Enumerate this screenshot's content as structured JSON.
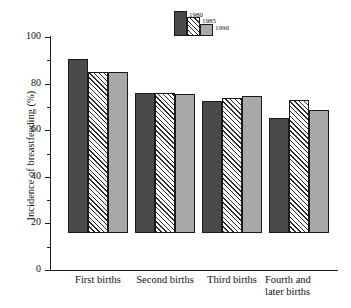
{
  "chart_data": {
    "type": "bar",
    "title": "",
    "xlabel": "",
    "ylabel": "Incidence of breastfeeding (%)",
    "ylim": [
      0,
      100
    ],
    "yticks": [
      "0",
      "20",
      "40",
      "60",
      "80",
      "100"
    ],
    "ytick_values": [
      0,
      20,
      40,
      60,
      80,
      100
    ],
    "minor_tick_values": [
      10,
      30,
      50,
      70,
      90
    ],
    "grid": false,
    "legend_position": "top-center",
    "categories": [
      "First births",
      "Second births",
      "Third births",
      "Fourth and later births"
    ],
    "category_lines": [
      [
        "First births"
      ],
      [
        "Second births"
      ],
      [
        "Third births"
      ],
      [
        "Fourth and",
        "later births"
      ]
    ],
    "series": [
      {
        "name": "1980",
        "color": "#4a4a4a",
        "fill": "solid-dark",
        "values": [
          74.5,
          60.3,
          56.5,
          49.5
        ]
      },
      {
        "name": "1985",
        "color": "#ffffff",
        "fill": "diagonal-hatch",
        "values": [
          69.0,
          60.3,
          57.8,
          57.0
        ]
      },
      {
        "name": "1990",
        "color": "#a8a8a8",
        "fill": "solid-light",
        "values": [
          69.0,
          59.8,
          59.0,
          53.0
        ]
      }
    ]
  },
  "legend": {
    "entries": [
      {
        "label": "1980"
      },
      {
        "label": "1985"
      },
      {
        "label": "1990"
      }
    ]
  },
  "axis": {
    "y_title": "Incidence of breastfeeding (%)",
    "tick_0": "0",
    "tick_20": "20",
    "tick_40": "40",
    "tick_60": "60",
    "tick_80": "80",
    "tick_100": "100"
  },
  "categories_text": {
    "c0_l0": "First births",
    "c1_l0": "Second births",
    "c2_l0": "Third births",
    "c3_l0": "Fourth and",
    "c3_l1": "later births"
  },
  "colors": {
    "series_1980": "#4a4a4a",
    "series_1985": "#ffffff",
    "series_1990": "#a8a8a8",
    "axis": "#1a1a1a",
    "text": "#111111",
    "background": "#ffffff"
  }
}
